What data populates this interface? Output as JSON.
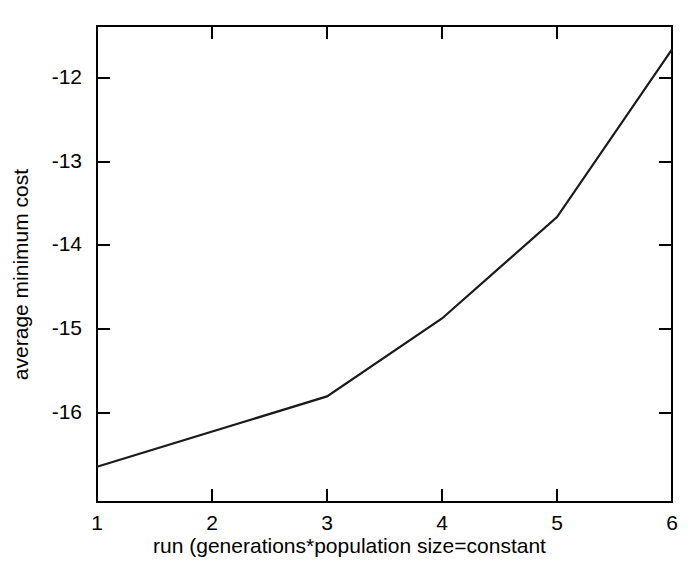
{
  "chart_data": {
    "type": "line",
    "title": "",
    "xlabel": "run (generations*population size=constant",
    "ylabel": "average minimum cost",
    "x": [
      1,
      3,
      4,
      5,
      6
    ],
    "values": [
      -16.74,
      -15.9,
      -14.97,
      -13.76,
      -11.76
    ],
    "series": [
      {
        "name": "average minimum cost",
        "x": [
          1,
          3,
          4,
          5,
          6
        ],
        "values": [
          -16.74,
          -15.9,
          -14.97,
          -13.76,
          -11.76
        ]
      }
    ],
    "xlim": [
      1,
      6
    ],
    "ylim": [
      -17.16,
      -11.48
    ],
    "xticks": [
      1,
      2,
      3,
      4,
      5,
      6
    ],
    "xtick_labels": [
      "1",
      "2",
      "3",
      "4",
      "5",
      "6"
    ],
    "yticks": [
      -12,
      -13,
      -14,
      -15,
      -16
    ],
    "ytick_labels": [
      "-12",
      "-13",
      "-14",
      "-15",
      "-16"
    ],
    "grid": false,
    "legend": null,
    "line_color": "#1a1a1a",
    "axis_color": "#000000",
    "background_color": "#ffffff"
  }
}
